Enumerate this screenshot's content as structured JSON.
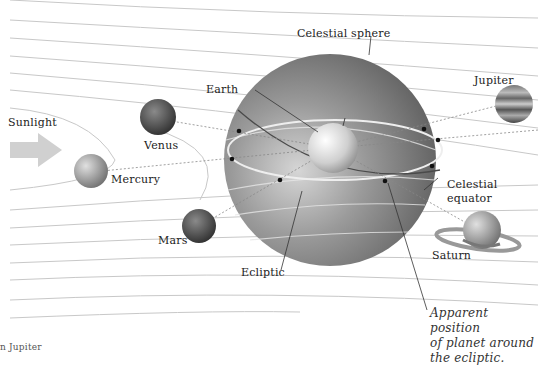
{
  "diagram": {
    "labels": {
      "celestial_sphere": "Celestial sphere",
      "earth": "Earth",
      "jupiter": "Jupiter",
      "sunlight": "Sunlight",
      "venus": "Venus",
      "mercury": "Mercury",
      "mars": "Mars",
      "celestial_equator": "Celestial\nequator",
      "ecliptic": "Ecliptic",
      "saturn": "Saturn",
      "apparent_position": "Apparent position\nof planet around\nthe ecliptic.",
      "caption_fragment": "n   Jupiter"
    },
    "colors": {
      "background": "#ffffff",
      "orbit_line": "#c8c8c8",
      "sphere_dark": "#6e6e6e",
      "sphere_light": "#d8d8d8",
      "arrow": "#cfcfcf",
      "leader": "#333333"
    }
  }
}
